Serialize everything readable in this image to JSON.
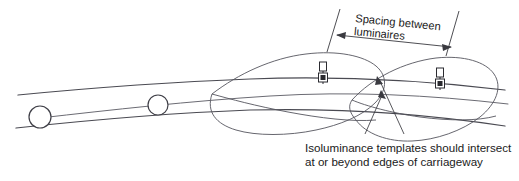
{
  "diagram": {
    "background_color": "#ffffff",
    "line_color": "#4a4a52",
    "text_color": "#1a1a1a",
    "annotations": {
      "spacing_label_line1": "Spacing between",
      "spacing_label_line2": "luminaires",
      "caption_line1": "Isoluminance templates should intersect",
      "caption_line2": "at or beyond edges of carriageway"
    },
    "road": {
      "near_edge_name": "carriageway near edge",
      "far_edge_name": "carriageway far edge",
      "center_name": "carriageway centre line",
      "marker_count": 2
    },
    "luminaires": {
      "count": 2,
      "symbol_name": "luminaire-post"
    },
    "templates": {
      "count": 2,
      "symbol_name": "isoluminance-template"
    }
  }
}
